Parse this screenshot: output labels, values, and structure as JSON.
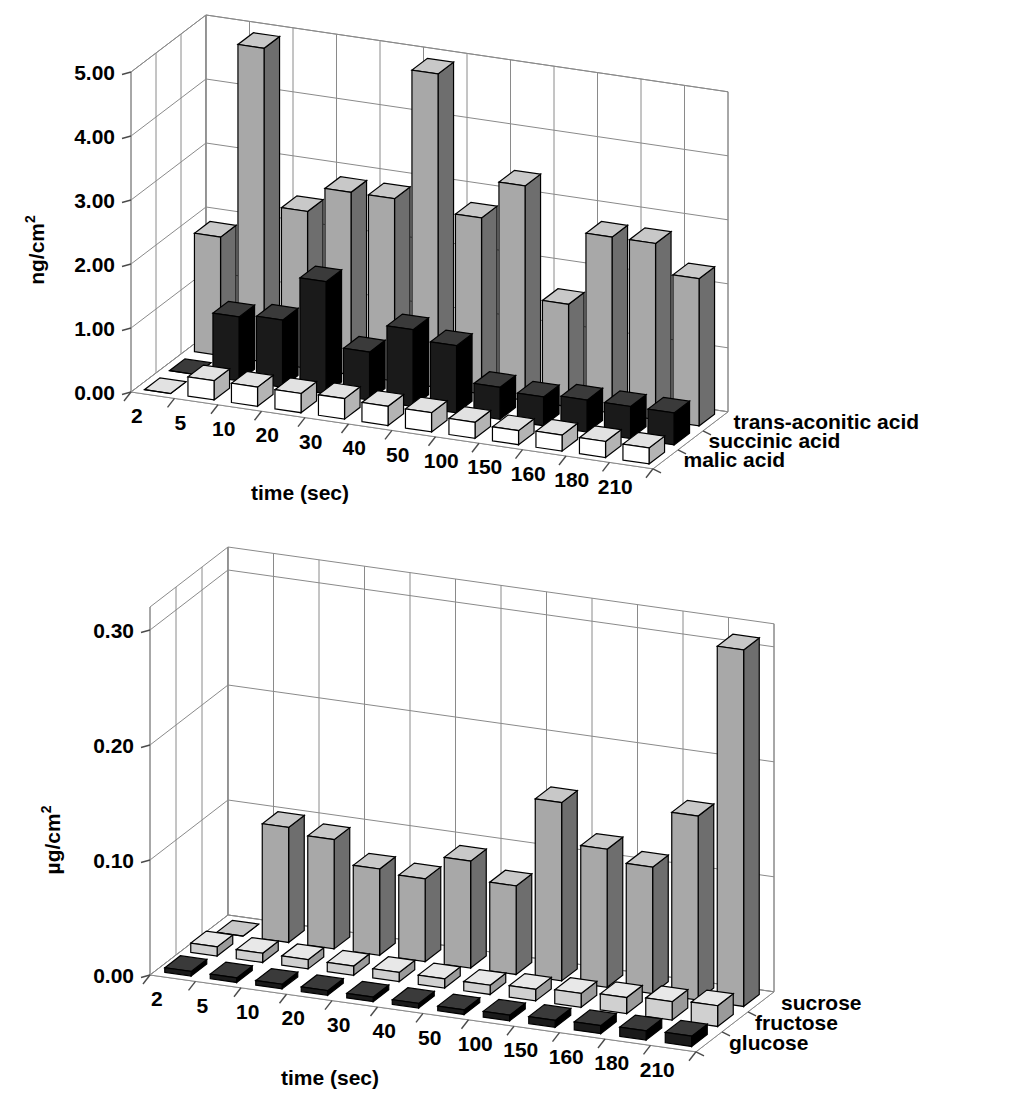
{
  "figure": {
    "background": "#ffffff",
    "charts": [
      "top",
      "bottom"
    ]
  },
  "top_chart": {
    "ylabel": "ng/cm",
    "ylabel_sup": "2",
    "xlabel": "time (sec)",
    "yticks": [
      "0.00",
      "1.00",
      "2.00",
      "3.00",
      "4.00",
      "5.00"
    ],
    "categories": [
      "2",
      "5",
      "10",
      "20",
      "30",
      "40",
      "50",
      "100",
      "150",
      "160",
      "180",
      "210"
    ],
    "legend": [
      "trans-aconitic acid",
      "succinic acid",
      "malic acid"
    ],
    "colors": {
      "series_back": "#a8a8a8",
      "series_mid": "#1a1a1a",
      "series_front": "#ffffff",
      "side_back": "#6e6e6e",
      "side_mid": "#000000",
      "side_front": "#b4b4b4",
      "top_back": "#c8c8c8",
      "top_mid": "#3a3a3a",
      "top_front": "#e2e2e2"
    }
  },
  "bottom_chart": {
    "ylabel": "µg/cm",
    "ylabel_sup": "2",
    "xlabel": "time (sec)",
    "yticks": [
      "0.00",
      "0.10",
      "0.20",
      "0.30"
    ],
    "categories": [
      "2",
      "5",
      "10",
      "20",
      "30",
      "40",
      "50",
      "100",
      "150",
      "160",
      "180",
      "210"
    ],
    "legend": [
      "sucrose",
      "fructose",
      "glucose"
    ],
    "colors": {
      "series_back": "#a8a8a8",
      "series_mid": "#d0d0d0",
      "series_front": "#1a1a1a",
      "side_back": "#6e6e6e",
      "side_mid": "#9a9a9a",
      "side_front": "#000000",
      "top_back": "#c8c8c8",
      "top_mid": "#e8e8e8",
      "top_front": "#3a3a3a"
    }
  },
  "chart_data": [
    {
      "type": "bar",
      "id": "top",
      "title": "",
      "xlabel": "time (sec)",
      "ylabel": "ng/cm2",
      "ylim": [
        0,
        5
      ],
      "yticks": [
        0,
        1,
        2,
        3,
        4,
        5
      ],
      "grid": true,
      "legend_position": "right",
      "three_d": true,
      "categories": [
        "2",
        "5",
        "10",
        "20",
        "30",
        "40",
        "50",
        "100",
        "150",
        "160",
        "180",
        "210"
      ],
      "series": [
        {
          "name": "trans-aconitic acid",
          "values": [
            1.85,
            4.9,
            2.45,
            2.85,
            2.85,
            4.9,
            2.75,
            3.35,
            1.6,
            2.75,
            2.75,
            2.3
          ]
        },
        {
          "name": "succinic acid",
          "values": [
            0.0,
            1.0,
            1.05,
            1.75,
            0.75,
            1.2,
            1.05,
            0.5,
            0.45,
            0.5,
            0.5,
            0.5
          ]
        },
        {
          "name": "malic acid",
          "values": [
            0.0,
            0.3,
            0.3,
            0.3,
            0.32,
            0.3,
            0.3,
            0.25,
            0.22,
            0.25,
            0.25,
            0.25
          ]
        }
      ]
    },
    {
      "type": "bar",
      "id": "bottom",
      "title": "",
      "xlabel": "time (sec)",
      "ylabel": "ug/cm2",
      "ylim": [
        0,
        0.32
      ],
      "yticks": [
        0.0,
        0.1,
        0.2,
        0.3
      ],
      "grid": true,
      "legend_position": "right",
      "three_d": true,
      "categories": [
        "2",
        "5",
        "10",
        "20",
        "30",
        "40",
        "50",
        "100",
        "150",
        "160",
        "180",
        "210"
      ],
      "series": [
        {
          "name": "sucrose",
          "values": [
            0.0,
            0.1,
            0.095,
            0.075,
            0.072,
            0.093,
            0.077,
            0.155,
            0.12,
            0.11,
            0.16,
            0.31
          ]
        },
        {
          "name": "fructose",
          "values": [
            0.008,
            0.008,
            0.008,
            0.008,
            0.008,
            0.008,
            0.008,
            0.01,
            0.012,
            0.014,
            0.016,
            0.018
          ]
        },
        {
          "name": "glucose",
          "values": [
            0.004,
            0.004,
            0.004,
            0.004,
            0.004,
            0.004,
            0.004,
            0.005,
            0.006,
            0.007,
            0.008,
            0.009
          ]
        }
      ]
    }
  ]
}
